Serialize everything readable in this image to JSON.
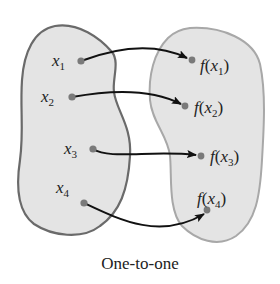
{
  "diagram": {
    "caption": "One-to-one",
    "colors": {
      "blob_fill": "#e4e4e4",
      "left_blob_stroke": "#6a6a6a",
      "right_blob_stroke": "#a8a8a8",
      "dot": "#7a7a7a",
      "arrow": "#111111",
      "text": "#222222"
    },
    "domain_points": [
      {
        "var": "x",
        "sub": "1"
      },
      {
        "var": "x",
        "sub": "2"
      },
      {
        "var": "x",
        "sub": "3"
      },
      {
        "var": "x",
        "sub": "4"
      }
    ],
    "range_points": [
      {
        "fn": "f",
        "open": "(",
        "var": "x",
        "sub": "1",
        "close": ")"
      },
      {
        "fn": "f",
        "open": "(",
        "var": "x",
        "sub": "2",
        "close": ")"
      },
      {
        "fn": "f",
        "open": "(",
        "var": "x",
        "sub": "3",
        "close": ")"
      },
      {
        "fn": "f",
        "open": "(",
        "var": "x",
        "sub": "4",
        "close": ")"
      }
    ],
    "mappings": [
      {
        "from": "x1",
        "to": "f(x1)"
      },
      {
        "from": "x2",
        "to": "f(x2)"
      },
      {
        "from": "x3",
        "to": "f(x3)"
      },
      {
        "from": "x4",
        "to": "f(x4)"
      }
    ]
  }
}
